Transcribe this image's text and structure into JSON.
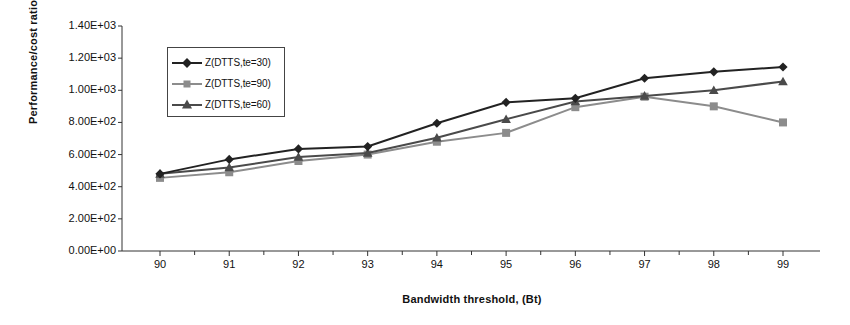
{
  "chart_data": {
    "type": "line",
    "title": "",
    "xlabel": "Bandwidth threshold, (Bt)",
    "ylabel": "Performance/cost ratio (Z)",
    "x": [
      90,
      91,
      92,
      93,
      94,
      95,
      96,
      97,
      98,
      99
    ],
    "xtick_labels": [
      "90",
      "91",
      "92",
      "93",
      "94",
      "95",
      "96",
      "97",
      "98",
      "99"
    ],
    "ytick_labels": [
      "1.40E+03",
      "1.20E+03",
      "1.00E+03",
      "8.00E+02",
      "6.00E+02",
      "4.00E+02",
      "2.00E+02",
      "0.00E+00"
    ],
    "ytick_values": [
      1400,
      1200,
      1000,
      800,
      600,
      400,
      200,
      0
    ],
    "ylim": [
      0,
      1400
    ],
    "xlim": [
      89.5,
      99.5
    ],
    "grid": false,
    "legend_position": "upper-left-inside",
    "series": [
      {
        "name": "Z(DTTS,te=30)",
        "marker": "diamond",
        "color": "#222222",
        "values": [
          480,
          570,
          635,
          650,
          795,
          925,
          950,
          1075,
          1115,
          1145
        ]
      },
      {
        "name": "Z(DTTS,te=90)",
        "marker": "square",
        "color": "#8c8c8c",
        "values": [
          455,
          490,
          560,
          600,
          680,
          735,
          895,
          960,
          900,
          800
        ]
      },
      {
        "name": "Z(DTTS,te=60)",
        "marker": "triangle",
        "color": "#4a4a4a",
        "values": [
          480,
          520,
          585,
          610,
          705,
          820,
          930,
          965,
          1000,
          1055
        ]
      }
    ]
  },
  "axis": {
    "line_color": "#333333"
  }
}
